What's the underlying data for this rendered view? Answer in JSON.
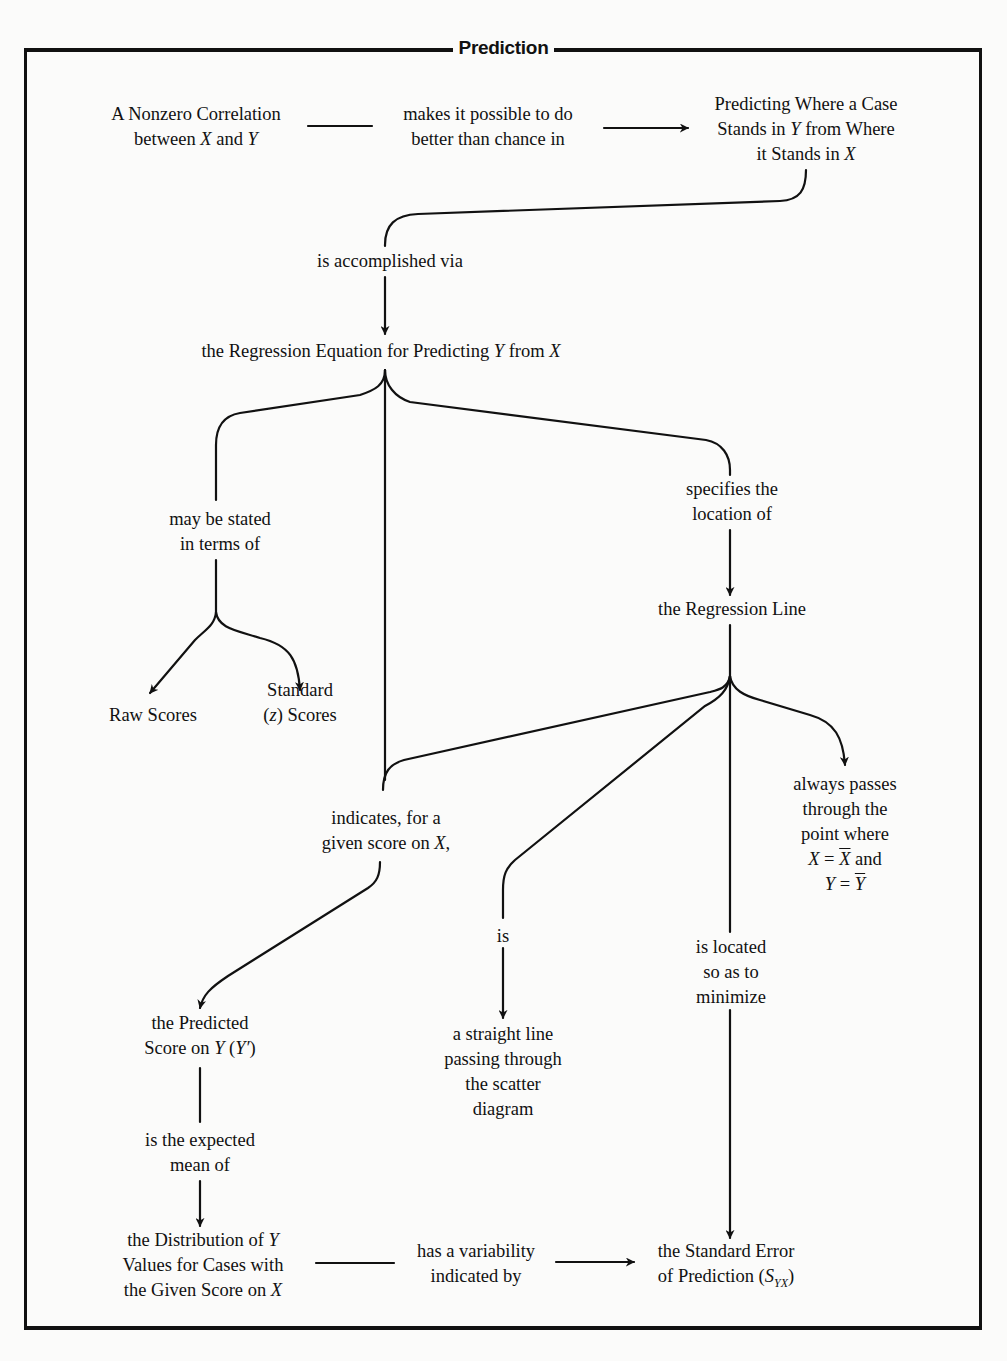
{
  "title": "Prediction",
  "nodes": {
    "nonzero_correlation": {
      "lines": [
        "A Nonzero Correlation",
        "between X and Y"
      ]
    },
    "makes_possible": {
      "lines": [
        "makes it possible to do",
        "better than chance in"
      ]
    },
    "predicting_where": {
      "lines": [
        "Predicting Where a Case",
        "Stands in Y from Where",
        "it Stands in X"
      ]
    },
    "accomplished_via": {
      "lines": [
        "is accomplished via"
      ]
    },
    "regression_equation": {
      "lines": [
        "the Regression Equation for Predicting Y from X"
      ]
    },
    "may_be_stated": {
      "lines": [
        "may be stated",
        "in terms of"
      ]
    },
    "raw_scores": {
      "lines": [
        "Raw Scores"
      ]
    },
    "standard_scores": {
      "lines": [
        "Standard",
        "(z) Scores"
      ]
    },
    "specifies_location": {
      "lines": [
        "specifies the",
        "location of"
      ]
    },
    "regression_line": {
      "lines": [
        "the Regression Line"
      ]
    },
    "always_passes": {
      "lines": [
        "always passes",
        "through the",
        "point where",
        "X = X̄ and",
        "Y = Ȳ"
      ]
    },
    "indicates": {
      "lines": [
        "indicates, for a",
        "given score on X,"
      ]
    },
    "is": {
      "lines": [
        "is"
      ]
    },
    "is_located": {
      "lines": [
        "is located",
        "so as to",
        "minimize"
      ]
    },
    "predicted_score": {
      "lines": [
        "the Predicted",
        "Score on Y (Y′)"
      ]
    },
    "straight_line": {
      "lines": [
        "a straight line",
        "passing through",
        "the scatter",
        "diagram"
      ]
    },
    "expected_mean": {
      "lines": [
        "is the expected",
        "mean of"
      ]
    },
    "distribution": {
      "lines": [
        "the Distribution of Y",
        "Values for Cases with",
        "the Given Score on X"
      ]
    },
    "has_variability": {
      "lines": [
        "has a variability",
        "indicated by"
      ]
    },
    "standard_error": {
      "lines": [
        "the Standard Error",
        "of Prediction (S_YX)"
      ]
    }
  },
  "colors": {
    "background": "#fbfbfa",
    "ink": "#111111"
  }
}
